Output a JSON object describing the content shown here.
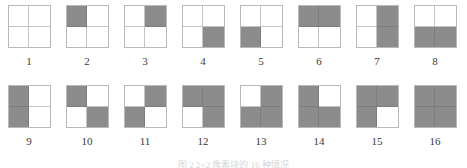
{
  "figure": {
    "caption": "图 2  2×2 像素块的 16 种情况",
    "fill_color": "#8c8c8c",
    "empty_color": "#ffffff",
    "border_color": "#b9b9b9",
    "quadrant_names": [
      "top-left",
      "top-right",
      "bottom-left",
      "bottom-right"
    ],
    "rows": [
      {
        "cells": [
          {
            "label": "1",
            "quads": [
              0,
              0,
              0,
              0
            ]
          },
          {
            "label": "2",
            "quads": [
              1,
              0,
              0,
              0
            ]
          },
          {
            "label": "3",
            "quads": [
              0,
              1,
              0,
              0
            ]
          },
          {
            "label": "4",
            "quads": [
              0,
              0,
              0,
              1
            ]
          },
          {
            "label": "5",
            "quads": [
              0,
              0,
              1,
              0
            ]
          },
          {
            "label": "6",
            "quads": [
              1,
              1,
              0,
              0
            ]
          },
          {
            "label": "7",
            "quads": [
              0,
              1,
              0,
              1
            ]
          },
          {
            "label": "8",
            "quads": [
              0,
              0,
              1,
              1
            ]
          }
        ]
      },
      {
        "cells": [
          {
            "label": "9",
            "quads": [
              1,
              0,
              1,
              0
            ]
          },
          {
            "label": "10",
            "quads": [
              1,
              0,
              0,
              1
            ]
          },
          {
            "label": "11",
            "quads": [
              0,
              1,
              1,
              0
            ]
          },
          {
            "label": "12",
            "quads": [
              1,
              1,
              0,
              1
            ]
          },
          {
            "label": "13",
            "quads": [
              0,
              1,
              1,
              1
            ]
          },
          {
            "label": "14",
            "quads": [
              1,
              0,
              1,
              1
            ]
          },
          {
            "label": "15",
            "quads": [
              1,
              1,
              1,
              0
            ]
          },
          {
            "label": "16",
            "quads": [
              1,
              1,
              1,
              1
            ]
          }
        ]
      }
    ]
  }
}
